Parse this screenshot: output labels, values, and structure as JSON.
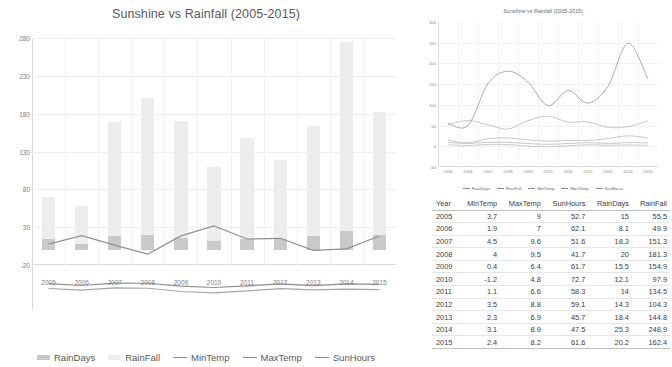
{
  "main": {
    "title": "Sunshine vs Rainfall (2005-2015)",
    "y_ticks": [
      "280",
      "230",
      "180",
      "130",
      "80",
      "30",
      "-20"
    ],
    "legend": [
      {
        "label": "RainDays",
        "type": "bar",
        "color": "#c9c9c9"
      },
      {
        "label": "RainFall",
        "type": "bar",
        "color": "#ededed"
      },
      {
        "label": "MinTemp",
        "type": "line",
        "color": "#8f8f8f"
      },
      {
        "label": "MaxTemp",
        "type": "line",
        "color": "#8f8f8f"
      },
      {
        "label": "SunHours",
        "type": "line",
        "color": "#8f8f8f"
      }
    ]
  },
  "mini": {
    "title": "Sunshine vs Rainfall (2005-2015)",
    "y_ticks": [
      "300",
      "250",
      "200",
      "150",
      "100",
      "50",
      "0",
      "-50"
    ],
    "legend": [
      {
        "label": "RainDays"
      },
      {
        "label": "RainFall"
      },
      {
        "label": "MinTemp"
      },
      {
        "label": "MaxTemp"
      },
      {
        "label": "SunHours"
      }
    ]
  },
  "table": {
    "headers": [
      "Year",
      "MinTemp",
      "MaxTemp",
      "SunHours",
      "RainDays",
      "RainFall"
    ],
    "rows": [
      [
        "2005",
        "3.7",
        "9",
        "52.7",
        "15",
        "55.5"
      ],
      [
        "2006",
        "1.9",
        "7",
        "62.1",
        "8.1",
        "49.9"
      ],
      [
        "2007",
        "4.5",
        "9.6",
        "51.6",
        "18.3",
        "151.3"
      ],
      [
        "2008",
        "4",
        "9.5",
        "41.7",
        "20",
        "181.3"
      ],
      [
        "2009",
        "0.4",
        "6.4",
        "61.7",
        "15.5",
        "154.9"
      ],
      [
        "2010",
        "-1.2",
        "4.8",
        "72.7",
        "12.1",
        "97.9"
      ],
      [
        "2011",
        "1.1",
        "6.6",
        "58.3",
        "14",
        "134.5"
      ],
      [
        "2012",
        "3.5",
        "8.8",
        "59.1",
        "14.3",
        "104.3"
      ],
      [
        "2013",
        "2.3",
        "6.9",
        "45.7",
        "18.4",
        "144.8"
      ],
      [
        "2014",
        "3.1",
        "8.9",
        "47.5",
        "25.3",
        "248.9"
      ],
      [
        "2015",
        "2.4",
        "8.2",
        "61.6",
        "20.2",
        "162.4"
      ]
    ]
  },
  "chart_data": {
    "type": "bar",
    "title": "Sunshine vs Rainfall (2005-2015)",
    "xlabel": "",
    "ylabel": "",
    "ylim": [
      -20,
      280
    ],
    "grid": true,
    "legend_position": "bottom",
    "categories": [
      "2005",
      "2006",
      "2007",
      "2008",
      "2009",
      "2010",
      "2011",
      "2012",
      "2013",
      "2014",
      "2015"
    ],
    "series": [
      {
        "name": "RainDays",
        "type": "bar-stacked",
        "color": "#c9c9c9",
        "values": [
          15,
          8.1,
          18.3,
          20,
          15.5,
          12.1,
          14,
          14.3,
          18.4,
          25.3,
          20.2
        ]
      },
      {
        "name": "RainFall",
        "type": "bar-stacked",
        "color": "#ededed",
        "values": [
          55.5,
          49.9,
          151.3,
          181.3,
          154.9,
          97.9,
          134.5,
          104.3,
          144.8,
          248.9,
          162.4
        ]
      },
      {
        "name": "MinTemp",
        "type": "line",
        "color": "#a6a6a6",
        "values": [
          3.7,
          1.9,
          4.5,
          4,
          0.4,
          -1.2,
          1.1,
          3.5,
          2.3,
          3.1,
          2.4
        ]
      },
      {
        "name": "MaxTemp",
        "type": "line",
        "color": "#8c8c8c",
        "values": [
          9,
          7,
          9.6,
          9.5,
          6.4,
          4.8,
          6.6,
          8.8,
          6.9,
          8.9,
          8.2
        ]
      },
      {
        "name": "SunHours",
        "type": "line",
        "color": "#8f8f8f",
        "values": [
          52.7,
          62.1,
          51.6,
          41.7,
          61.7,
          72.7,
          58.3,
          59.1,
          45.7,
          47.5,
          61.6
        ]
      }
    ]
  }
}
